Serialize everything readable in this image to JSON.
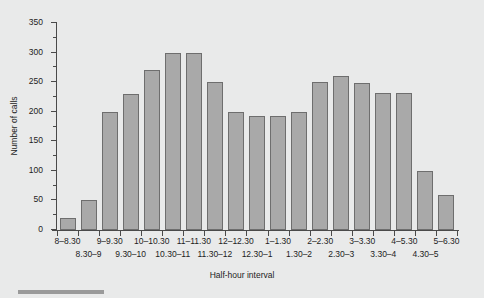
{
  "chart_data": {
    "type": "bar",
    "title": "",
    "xlabel": "Half-hour interval",
    "ylabel": "Number of calls",
    "categories": [
      "8–8.30",
      "8.30–9",
      "9–9.30",
      "9.30–10",
      "10–10.30",
      "10.30–11",
      "11–11.30",
      "11.30–12",
      "12–12.30",
      "12.30–1",
      "1–1.30",
      "1.30–2",
      "2–2.30",
      "2.30–3",
      "3–3.30",
      "3.30–4",
      "4–5.30",
      "4.30–5",
      "5–6.30"
    ],
    "values": [
      20,
      50,
      200,
      230,
      270,
      300,
      300,
      250,
      200,
      193,
      192,
      200,
      250,
      260,
      249,
      232,
      232,
      100,
      60
    ],
    "ylim": [
      0,
      350
    ],
    "yticks": [
      0,
      50,
      100,
      150,
      200,
      250,
      300,
      350
    ],
    "ytick_labels": [
      "0",
      "50",
      "100",
      "150",
      "200",
      "250",
      "300",
      "350"
    ],
    "yticks_minor": [
      25,
      75,
      125,
      175,
      225,
      275,
      325
    ],
    "grid": false,
    "legend": "none",
    "bar_fill": "#a9a9a9",
    "bar_edge": "#6e6e6e",
    "background": "#e9eaea"
  }
}
